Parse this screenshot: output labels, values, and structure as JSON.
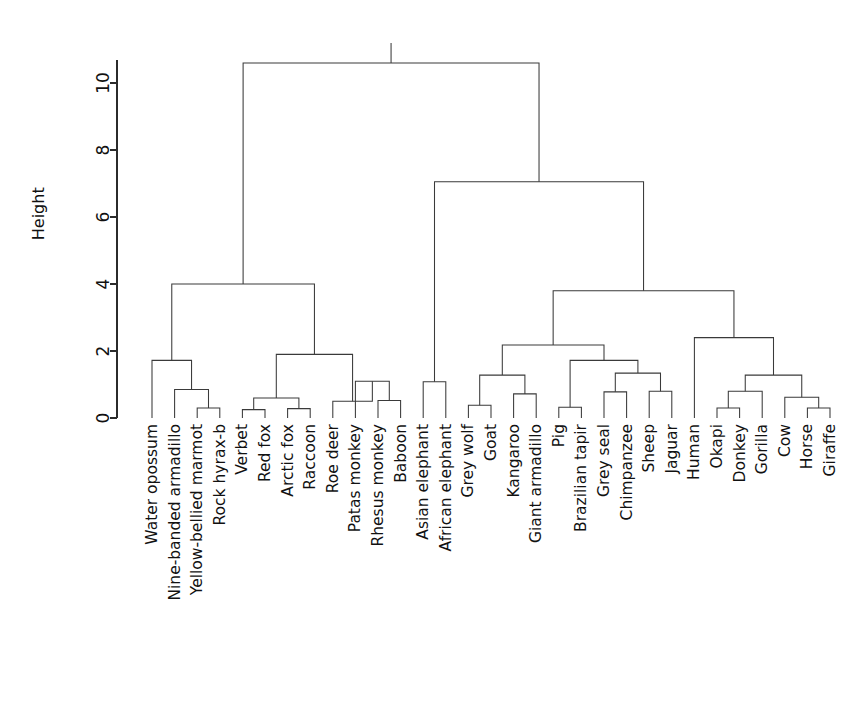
{
  "figure": {
    "kind": "dendrogram",
    "background": "#ffffff",
    "line_color": "#3a3a3a",
    "text_color": "#111111"
  },
  "axis": {
    "title": "Height",
    "tick_labels": [
      "0",
      "2",
      "4",
      "6",
      "8",
      "10"
    ],
    "tick_values": [
      0,
      2,
      4,
      6,
      8,
      10
    ],
    "range": [
      0,
      10.7
    ]
  },
  "chart_data": {
    "type": "dendrogram",
    "title": "",
    "xlabel": "",
    "ylabel": "Height",
    "ylim": [
      0,
      10.7
    ],
    "grid": false,
    "legend": "none",
    "orientation": "vertical",
    "leaf_count": 30,
    "leaf_labels": [
      "Water opossum",
      "Nine-banded armadillo",
      "Yellow-bellied marmot",
      "Rock hyrax-b",
      "Verbet",
      "Red fox",
      "Arctic fox",
      "Raccoon",
      "Roe deer",
      "Patas monkey",
      "Rhesus monkey",
      "Baboon",
      "Asian elephant",
      "African elephant",
      "Grey wolf",
      "Goat",
      "Kangaroo",
      "Giant armadillo",
      "Pig",
      "Brazilian tapir",
      "Grey seal",
      "Chimpanzee",
      "Sheep",
      "Jaguar",
      "Human",
      "Okapi",
      "Donkey",
      "Gorilla",
      "Cow",
      "Horse",
      "Giraffe"
    ],
    "merges": [
      {
        "id": "n1",
        "label": "Yellow-bellied marmot + Rock hyrax-b",
        "height": 0.3,
        "left": {
          "leaf": 2
        },
        "right": {
          "leaf": 3
        }
      },
      {
        "id": "n2",
        "label": "Nine-banded armadillo + n1",
        "height": 0.85,
        "left": {
          "leaf": 1
        },
        "right": {
          "node": "n1"
        }
      },
      {
        "id": "n3",
        "label": "Water opossum + n2",
        "height": 1.72,
        "left": {
          "leaf": 0
        },
        "right": {
          "node": "n2"
        }
      },
      {
        "id": "n4",
        "label": "Verbet + Red fox",
        "height": 0.25,
        "left": {
          "leaf": 4
        },
        "right": {
          "leaf": 5
        }
      },
      {
        "id": "n5",
        "label": "Arctic fox + Raccoon",
        "height": 0.28,
        "left": {
          "leaf": 6
        },
        "right": {
          "leaf": 7
        }
      },
      {
        "id": "n6",
        "label": "n4 + n5",
        "height": 0.6,
        "left": {
          "node": "n4"
        },
        "right": {
          "node": "n5"
        }
      },
      {
        "id": "n7",
        "label": "Rhesus monkey + Baboon",
        "height": 0.52,
        "left": {
          "leaf": 10
        },
        "right": {
          "leaf": 11
        }
      },
      {
        "id": "n8",
        "label": "Patas monkey + n7",
        "height": 1.1,
        "left": {
          "leaf": 9
        },
        "right": {
          "node": "n7"
        }
      },
      {
        "id": "n9",
        "label": "Roe deer + n8",
        "height": 0.5,
        "left": {
          "leaf": 8
        },
        "right": {
          "node": "n8"
        }
      },
      {
        "id": "n10",
        "label": "n6 + n9",
        "height": 1.9,
        "left": {
          "node": "n6"
        },
        "right": {
          "node": "n9"
        }
      },
      {
        "id": "n11",
        "label": "left-mammal-group",
        "height": 4.0,
        "left": {
          "node": "n3"
        },
        "right": {
          "node": "n10"
        }
      },
      {
        "id": "n12",
        "label": "Asian elephant + African elephant",
        "height": 1.08,
        "left": {
          "leaf": 12
        },
        "right": {
          "leaf": 13
        }
      },
      {
        "id": "n13",
        "label": "Grey wolf + Goat",
        "height": 0.38,
        "left": {
          "leaf": 14
        },
        "right": {
          "leaf": 15
        }
      },
      {
        "id": "n14",
        "label": "Kangaroo + Giant armadillo",
        "height": 0.72,
        "left": {
          "leaf": 16
        },
        "right": {
          "leaf": 17
        }
      },
      {
        "id": "n15",
        "label": "n13 + n14",
        "height": 1.28,
        "left": {
          "node": "n13"
        },
        "right": {
          "node": "n14"
        }
      },
      {
        "id": "n16",
        "label": "Pig + Brazilian tapir",
        "height": 0.32,
        "left": {
          "leaf": 18
        },
        "right": {
          "leaf": 19
        }
      },
      {
        "id": "n17",
        "label": "Grey seal + Chimpanzee",
        "height": 0.78,
        "left": {
          "leaf": 20
        },
        "right": {
          "leaf": 21
        }
      },
      {
        "id": "n18",
        "label": "Sheep + Jaguar",
        "height": 0.8,
        "left": {
          "leaf": 22
        },
        "right": {
          "leaf": 23
        }
      },
      {
        "id": "n19",
        "label": "n17 + n18",
        "height": 1.34,
        "left": {
          "node": "n17"
        },
        "right": {
          "node": "n18"
        }
      },
      {
        "id": "n20",
        "label": "n16 + n19",
        "height": 1.72,
        "left": {
          "node": "n16"
        },
        "right": {
          "node": "n19"
        }
      },
      {
        "id": "n21",
        "label": "n15 + n20",
        "height": 2.18,
        "left": {
          "node": "n15"
        },
        "right": {
          "node": "n20"
        }
      },
      {
        "id": "n22",
        "label": "Okapi + Donkey",
        "height": 0.3,
        "left": {
          "leaf": 25
        },
        "right": {
          "leaf": 26
        }
      },
      {
        "id": "n23",
        "label": "n22 + Gorilla",
        "height": 0.8,
        "left": {
          "node": "n22"
        },
        "right": {
          "leaf": 27
        }
      },
      {
        "id": "n24",
        "label": "Horse + Giraffe",
        "height": 0.3,
        "left": {
          "leaf": 29
        },
        "right": {
          "leaf": 30
        }
      },
      {
        "id": "n25",
        "label": "Cow + n24",
        "height": 0.62,
        "left": {
          "leaf": 28
        },
        "right": {
          "node": "n24"
        }
      },
      {
        "id": "n26",
        "label": "n23 + n25",
        "height": 1.28,
        "left": {
          "node": "n23"
        },
        "right": {
          "node": "n25"
        }
      },
      {
        "id": "n27",
        "label": "Human + n26",
        "height": 2.4,
        "left": {
          "leaf": 24
        },
        "right": {
          "node": "n26"
        }
      },
      {
        "id": "n28",
        "label": "n21 + n27",
        "height": 3.8,
        "left": {
          "node": "n21"
        },
        "right": {
          "node": "n27"
        }
      },
      {
        "id": "n29",
        "label": "n12 + n28",
        "height": 7.05,
        "left": {
          "node": "n12"
        },
        "right": {
          "node": "n28"
        }
      },
      {
        "id": "n30",
        "label": "root",
        "height": 10.6,
        "left": {
          "node": "n11"
        },
        "right": {
          "node": "n29"
        }
      }
    ]
  },
  "geometry": {
    "axis_x": 117,
    "y_zero": 418,
    "px_per_unit": 33.5,
    "leaf_x_start": 152,
    "leaf_spacing": 22.6,
    "label_top": 424
  }
}
